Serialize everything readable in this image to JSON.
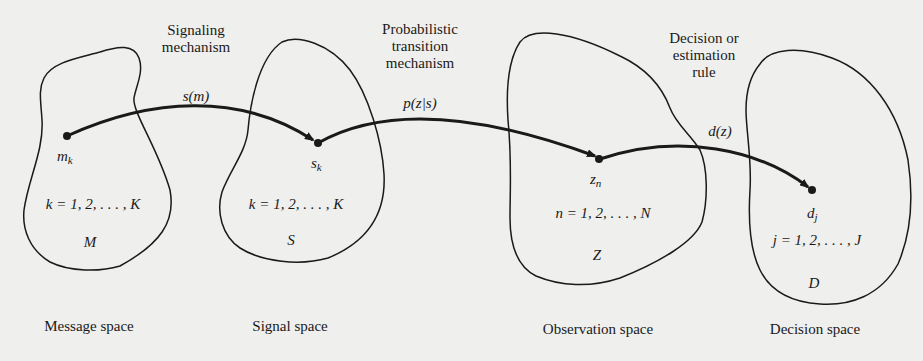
{
  "diagram": {
    "stroke_color": "#1a1a1a",
    "background_color": "#efefed",
    "spaces": [
      {
        "id": "message",
        "caption": "Message space",
        "set_symbol": "M",
        "point_base": "m",
        "point_sub": "k",
        "index_range": "k = 1, 2, . . . , K"
      },
      {
        "id": "signal",
        "caption": "Signal space",
        "set_symbol": "S",
        "point_base": "s",
        "point_sub": "k",
        "index_range": "k = 1, 2, . . . , K"
      },
      {
        "id": "observation",
        "caption": "Observation space",
        "set_symbol": "Z",
        "point_base": "z",
        "point_sub": "n",
        "index_range": "n = 1, 2, . . . , N"
      },
      {
        "id": "decision",
        "caption": "Decision space",
        "set_symbol": "D",
        "point_base": "d",
        "point_sub": "j",
        "index_range": "j = 1, 2, . . . , J"
      }
    ],
    "mappings": [
      {
        "from": "message",
        "to": "signal",
        "title_line1": "Signaling",
        "title_line2": "mechanism",
        "title_line3": "",
        "function": "s(m)"
      },
      {
        "from": "signal",
        "to": "observation",
        "title_line1": "Probabilistic",
        "title_line2": "transition",
        "title_line3": "mechanism",
        "function": "p(z|s)"
      },
      {
        "from": "observation",
        "to": "decision",
        "title_line1": "Decision or",
        "title_line2": "estimation",
        "title_line3": "rule",
        "function": "d(z)"
      }
    ]
  }
}
